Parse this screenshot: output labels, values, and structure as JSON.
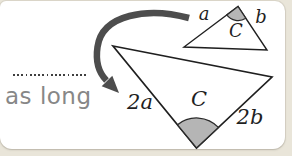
{
  "card": {
    "background": "#ffffff",
    "outer_background": "#e9e5d9"
  },
  "caption": {
    "text": "as long"
  },
  "diagram": {
    "arrow_icon": "curved-arrow-down-left",
    "line_color": "#1f1f1f",
    "arrow_color": "#4d4d4d",
    "angle_fill": "#b5b5b5",
    "small_triangle": {
      "label_a": "a",
      "label_b": "b",
      "label_angle": "C"
    },
    "large_triangle": {
      "label_a": "2a",
      "label_b": "2b",
      "label_angle": "C"
    }
  }
}
